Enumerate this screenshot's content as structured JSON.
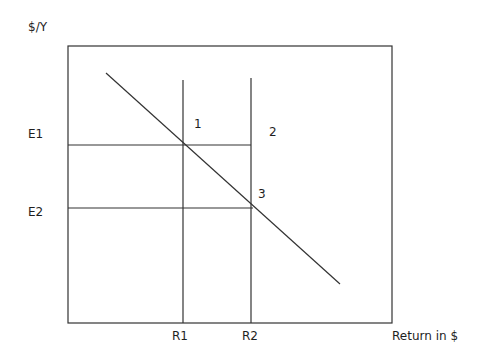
{
  "diagram": {
    "y_axis_label": "$/Y",
    "x_axis_label": "Return in $",
    "y_levels": [
      {
        "id": "E1",
        "label": "E1"
      },
      {
        "id": "E2",
        "label": "E2"
      }
    ],
    "x_levels": [
      {
        "id": "R1",
        "label": "R1"
      },
      {
        "id": "R2",
        "label": "R2"
      }
    ],
    "regions": [
      {
        "id": "1",
        "label": "1"
      },
      {
        "id": "2",
        "label": "2"
      },
      {
        "id": "3",
        "label": "3"
      }
    ],
    "curve": {
      "type": "downward-sloping line",
      "passes_through": [
        "E1-R1",
        "E2-R2"
      ]
    }
  }
}
